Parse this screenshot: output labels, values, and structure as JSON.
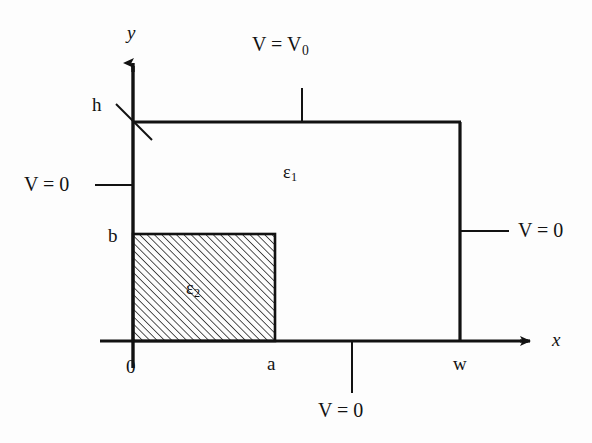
{
  "figure": {
    "type": "physics-boundary-value-diagram",
    "background_color": "#fdfdfd",
    "line_color": "#121212"
  },
  "axes": {
    "y_axis_label": "y",
    "x_axis_label": "x",
    "origin_label": "0"
  },
  "dimensions": {
    "height_label": "h",
    "slab_height_label": "b",
    "slab_width_label": "a",
    "width_label": "w"
  },
  "regions": {
    "outer": {
      "permittivity_label": "ε",
      "permittivity_subscript": "1"
    },
    "inner": {
      "permittivity_label": "ε",
      "permittivity_subscript": "2",
      "fill": "hatched"
    }
  },
  "boundary_conditions": {
    "top": {
      "label": "V = V",
      "subscript": "0"
    },
    "left": {
      "label": "V = 0"
    },
    "right": {
      "label": "V = 0"
    },
    "bottom": {
      "label": "V = 0"
    }
  },
  "geometry": {
    "domain_left_x": 133,
    "domain_right_x": 460,
    "domain_top_y": 122,
    "domain_bottom_y": 341,
    "slab_right_x": 275,
    "slab_top_y": 234,
    "y_axis_arrow_tip_y": 58,
    "x_axis_arrow_tip_x": 537,
    "x_axis_left_end": 100
  }
}
